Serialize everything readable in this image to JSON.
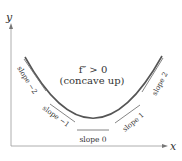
{
  "axes": {
    "x_label": "x",
    "y_label": "y"
  },
  "annotation": {
    "line1": "f″ > 0",
    "line2": "(concave up)"
  },
  "tangent_labels": {
    "slope_neg2": "slope −2",
    "slope_neg1": "slope −1",
    "slope_0": "slope 0",
    "slope_1": "slope 1",
    "slope_2": "slope 2"
  },
  "colors": {
    "curve": "#555555",
    "axis": "#888888",
    "text": "#333333"
  }
}
